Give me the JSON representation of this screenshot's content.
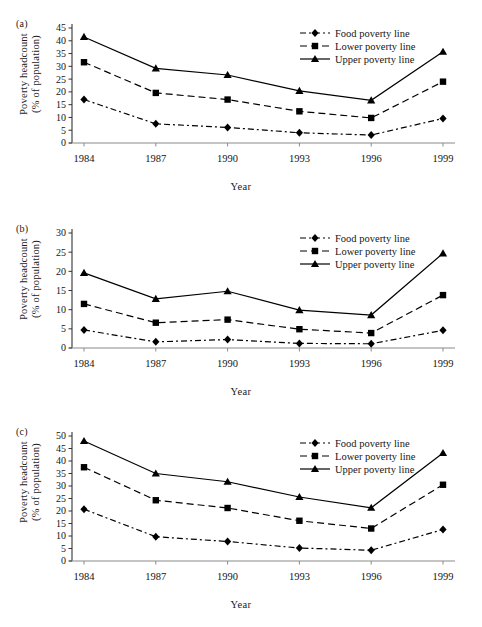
{
  "figure": {
    "axis_color": "#333333",
    "series_color": "#000000",
    "xlabel": "Year",
    "ylabel_line1": "Poverty headcount",
    "ylabel_line2": "(% of population)",
    "categories": [
      "1984",
      "1987",
      "1990",
      "1993",
      "1996",
      "1999"
    ],
    "legend": [
      {
        "label": "Food poverty line",
        "marker": "diamond",
        "dash": "dashdot"
      },
      {
        "label": "Lower poverty line",
        "marker": "square",
        "dash": "dashed"
      },
      {
        "label": "Upper poverty line",
        "marker": "triangle",
        "dash": "solid"
      }
    ]
  },
  "panels": [
    {
      "id": "a",
      "label": "(a)"
    },
    {
      "id": "b",
      "label": "(b)"
    },
    {
      "id": "c",
      "label": "(c)"
    }
  ],
  "chart_data": [
    {
      "type": "line",
      "panel": "(a)",
      "title": "",
      "xlabel": "Year",
      "ylabel": "Poverty headcount (% of population)",
      "x": [
        "1984",
        "1987",
        "1990",
        "1993",
        "1996",
        "1999"
      ],
      "ylim": [
        0,
        45
      ],
      "yticks": [
        0,
        5,
        10,
        15,
        20,
        25,
        30,
        35,
        40,
        45
      ],
      "grid": false,
      "legend_position": "top-right",
      "series": [
        {
          "name": "Food poverty line",
          "marker": "diamond",
          "dash": "dashdot",
          "values": [
            17.0,
            7.5,
            6.1,
            4.0,
            3.1,
            9.6
          ]
        },
        {
          "name": "Lower poverty line",
          "marker": "square",
          "dash": "dashed",
          "values": [
            31.6,
            19.6,
            17.0,
            12.4,
            9.8,
            24.0
          ]
        },
        {
          "name": "Upper poverty line",
          "marker": "triangle",
          "dash": "solid",
          "values": [
            41.5,
            29.2,
            26.6,
            20.4,
            16.7,
            35.7
          ]
        }
      ]
    },
    {
      "type": "line",
      "panel": "(b)",
      "title": "",
      "xlabel": "Year",
      "ylabel": "Poverty headcount (% of population)",
      "x": [
        "1984",
        "1987",
        "1990",
        "1993",
        "1996",
        "1999"
      ],
      "ylim": [
        0,
        30
      ],
      "yticks": [
        0,
        5,
        10,
        15,
        20,
        25,
        30
      ],
      "grid": false,
      "legend_position": "top-right",
      "series": [
        {
          "name": "Food poverty line",
          "marker": "diamond",
          "dash": "dashdot",
          "values": [
            4.7,
            1.6,
            2.2,
            1.2,
            1.1,
            4.6
          ]
        },
        {
          "name": "Lower poverty line",
          "marker": "square",
          "dash": "dashed",
          "values": [
            11.5,
            6.6,
            7.4,
            4.9,
            3.9,
            13.8
          ]
        },
        {
          "name": "Upper poverty line",
          "marker": "triangle",
          "dash": "solid",
          "values": [
            19.6,
            12.8,
            14.8,
            9.9,
            8.6,
            24.7
          ]
        }
      ]
    },
    {
      "type": "line",
      "panel": "(c)",
      "title": "",
      "xlabel": "Year",
      "ylabel": "Poverty headcount (% of population)",
      "x": [
        "1984",
        "1987",
        "1990",
        "1993",
        "1996",
        "1999"
      ],
      "ylim": [
        0,
        50
      ],
      "yticks": [
        0,
        5,
        10,
        15,
        20,
        25,
        30,
        35,
        40,
        45,
        50
      ],
      "grid": false,
      "legend_position": "top-right",
      "series": [
        {
          "name": "Food poverty line",
          "marker": "diamond",
          "dash": "dashdot",
          "values": [
            20.7,
            9.7,
            7.8,
            5.2,
            4.3,
            12.6
          ]
        },
        {
          "name": "Lower poverty line",
          "marker": "square",
          "dash": "dashed",
          "values": [
            37.5,
            24.3,
            21.2,
            16.1,
            13.0,
            30.5
          ]
        },
        {
          "name": "Upper poverty line",
          "marker": "triangle",
          "dash": "solid",
          "values": [
            48.0,
            35.0,
            31.7,
            25.6,
            21.3,
            43.2
          ]
        }
      ]
    }
  ]
}
